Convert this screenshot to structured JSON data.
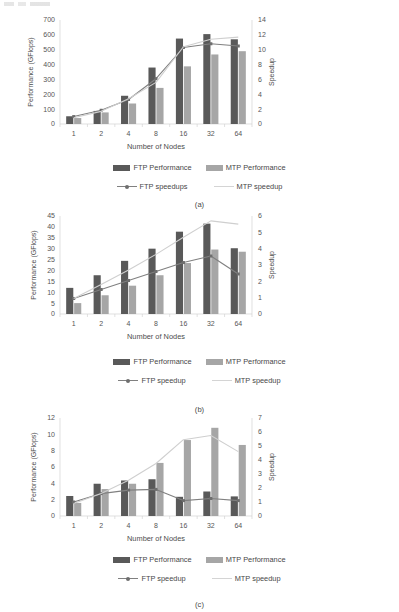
{
  "page": {
    "caption_a": "(a)",
    "caption_b": "(b)",
    "caption_c": "(c)"
  },
  "colors": {
    "ftp_bar": "#595959",
    "mtp_bar": "#a6a6a6",
    "ftp_line": "#808080",
    "mtp_line": "#cfcfcf",
    "axis": "#d2d2d2",
    "grid": "#f1f1f1",
    "text": "#4d4d4d"
  },
  "legend": {
    "ftp_performance": "FTP Performance",
    "mtp_performance": "MTP Performance",
    "ftp_speedup_a": "FTP speedups",
    "ftp_speedup": "FTP speedup",
    "mtp_speedup": "MTP speedup"
  },
  "chart_data": [
    {
      "id": "a",
      "type": "bar",
      "title": "",
      "caption": "(a)",
      "xlabel": "Number of Nodes",
      "ylabel": "Performance (GFlops)",
      "y2label": "Speedup",
      "categories": [
        "1",
        "2",
        "4",
        "8",
        "16",
        "32",
        "64"
      ],
      "ylim": [
        0,
        700
      ],
      "yticks": [
        0,
        100,
        200,
        300,
        400,
        500,
        600,
        700
      ],
      "y2lim": [
        0,
        14
      ],
      "y2ticks": [
        0,
        2,
        4,
        6,
        8,
        10,
        12,
        14
      ],
      "grid": false,
      "legend_position": "bottom",
      "series": [
        {
          "name": "FTP Performance",
          "type": "bar",
          "axis": "left",
          "values": [
            52,
            88,
            190,
            380,
            575,
            605,
            570
          ]
        },
        {
          "name": "MTP Performance",
          "type": "bar",
          "axis": "left",
          "values": [
            40,
            78,
            138,
            243,
            388,
            468,
            490
          ]
        },
        {
          "name": "FTP speedups",
          "type": "line",
          "axis": "right",
          "values": [
            1.0,
            1.85,
            3.3,
            6.1,
            10.3,
            10.8,
            10.5
          ]
        },
        {
          "name": "MTP speedup",
          "type": "line",
          "axis": "right",
          "values": [
            0.85,
            1.7,
            3.4,
            5.6,
            10.4,
            11.4,
            11.7
          ]
        }
      ]
    },
    {
      "id": "b",
      "type": "bar",
      "title": "",
      "caption": "(b)",
      "xlabel": "Number of Nodes",
      "ylabel": "Performance (GFlops)",
      "y2label": "Speedup",
      "categories": [
        "1",
        "2",
        "4",
        "8",
        "16",
        "32",
        "64"
      ],
      "ylim": [
        0,
        45
      ],
      "yticks": [
        0,
        5,
        10,
        15,
        20,
        25,
        30,
        35,
        40,
        45
      ],
      "y2lim": [
        0,
        6
      ],
      "y2ticks": [
        0,
        1,
        2,
        3,
        4,
        5,
        6
      ],
      "grid": false,
      "legend_position": "bottom",
      "series": [
        {
          "name": "FTP Performance",
          "type": "bar",
          "axis": "left",
          "values": [
            12.0,
            17.8,
            24.4,
            30.0,
            37.8,
            41.5,
            30.2
          ]
        },
        {
          "name": "MTP Performance",
          "type": "bar",
          "axis": "left",
          "values": [
            5.0,
            8.6,
            13.0,
            17.8,
            23.4,
            29.6,
            28.6
          ]
        },
        {
          "name": "FTP speedup",
          "type": "line",
          "axis": "right",
          "values": [
            0.95,
            1.5,
            2.05,
            2.6,
            3.15,
            3.55,
            2.45
          ]
        },
        {
          "name": "MTP speedup",
          "type": "line",
          "axis": "right",
          "values": [
            0.95,
            1.8,
            2.7,
            3.65,
            4.7,
            5.7,
            5.5
          ]
        }
      ]
    },
    {
      "id": "c",
      "type": "bar",
      "title": "",
      "caption": "(c)",
      "xlabel": "Number of Nodes",
      "ylabel": "Performance (GFlops)",
      "y2label": "Speedup",
      "categories": [
        "1",
        "2",
        "4",
        "8",
        "16",
        "32",
        "64"
      ],
      "ylim": [
        0,
        12
      ],
      "yticks": [
        0,
        2,
        4,
        6,
        8,
        10,
        12
      ],
      "y2lim": [
        0,
        7
      ],
      "y2ticks": [
        0,
        1,
        2,
        3,
        4,
        5,
        6,
        7
      ],
      "grid": false,
      "legend_position": "bottom",
      "series": [
        {
          "name": "FTP Performance",
          "type": "bar",
          "axis": "left",
          "values": [
            2.45,
            3.95,
            4.35,
            4.5,
            2.35,
            3.0,
            2.4
          ]
        },
        {
          "name": "MTP Performance",
          "type": "bar",
          "axis": "left",
          "values": [
            1.6,
            3.3,
            3.95,
            6.5,
            9.3,
            10.8,
            8.7
          ]
        },
        {
          "name": "FTP speedup",
          "type": "line",
          "axis": "right",
          "values": [
            1.0,
            1.6,
            1.85,
            1.9,
            1.1,
            1.25,
            1.1
          ]
        },
        {
          "name": "MTP speedup",
          "type": "line",
          "axis": "right",
          "values": [
            0.9,
            1.6,
            2.55,
            3.75,
            5.45,
            5.75,
            4.6
          ]
        }
      ]
    }
  ]
}
